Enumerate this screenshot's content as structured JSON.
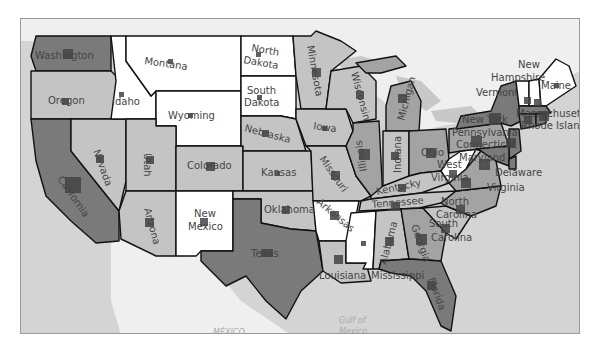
{
  "map": {
    "type": "choropleth-with-proportional-markers",
    "colors": {
      "ocean": "#d4d4d4",
      "foreign_land": "#efefef",
      "lakes": "#c8c8c8",
      "level_1": "#ffffff",
      "level_2": "#c4c4c4",
      "level_3": "#a3a3a3",
      "level_4": "#7a7a7a",
      "marker": "#444444",
      "border": "#111111"
    },
    "geo_labels": {
      "mexico": "MÉXICO",
      "gulf": "Gulf of",
      "gulf2": "Mexico"
    },
    "states": [
      {
        "name": "Washington",
        "level": 4,
        "marker": 9
      },
      {
        "name": "Oregon",
        "level": 2,
        "marker": 7
      },
      {
        "name": "California",
        "level": 4,
        "marker": 16
      },
      {
        "name": "Nevada",
        "level": 2,
        "marker": 8
      },
      {
        "name": "Idaho",
        "level": 1,
        "marker": 5
      },
      {
        "name": "Montana",
        "level": 1,
        "marker": 5
      },
      {
        "name": "Wyoming",
        "level": 1,
        "marker": 5
      },
      {
        "name": "Utah",
        "level": 2,
        "marker": 8
      },
      {
        "name": "Arizona",
        "level": 2,
        "marker": 9
      },
      {
        "name": "Colorado",
        "level": 2,
        "marker": 9
      },
      {
        "name": "New Mexico",
        "level": 1,
        "marker": 8
      },
      {
        "name": "North Dakota",
        "level": 1,
        "marker": 5
      },
      {
        "name": "South Dakota",
        "level": 1,
        "marker": 5
      },
      {
        "name": "Nebraska",
        "level": 2,
        "marker": 7
      },
      {
        "name": "Kansas",
        "level": 2,
        "marker": 5
      },
      {
        "name": "Oklahoma",
        "level": 2,
        "marker": 8
      },
      {
        "name": "Texas",
        "level": 4,
        "marker": 12
      },
      {
        "name": "Minnesota",
        "level": 2,
        "marker": 9
      },
      {
        "name": "Iowa",
        "level": 2,
        "marker": 5
      },
      {
        "name": "Missouri",
        "level": 2,
        "marker": 9
      },
      {
        "name": "Arkansas",
        "level": 1,
        "marker": 9
      },
      {
        "name": "Louisiana",
        "level": 2,
        "marker": 9
      },
      {
        "name": "Wisconsin",
        "level": 2,
        "marker": 8
      },
      {
        "name": "Illinois",
        "level": 3,
        "marker": 11
      },
      {
        "name": "Michigan",
        "level": 3,
        "marker": 9
      },
      {
        "name": "Indiana",
        "level": 2,
        "marker": 8
      },
      {
        "name": "Ohio",
        "level": 3,
        "marker": 10
      },
      {
        "name": "Kentucky",
        "level": 2,
        "marker": 8
      },
      {
        "name": "Tennessee",
        "level": 2,
        "marker": 9
      },
      {
        "name": "Mississippi",
        "level": 1,
        "marker": 5
      },
      {
        "name": "Alabama",
        "level": 2,
        "marker": 9
      },
      {
        "name": "Georgia",
        "level": 3,
        "marker": 11
      },
      {
        "name": "Florida",
        "level": 4,
        "marker": 9
      },
      {
        "name": "South Carolina",
        "level": 2,
        "marker": 9
      },
      {
        "name": "North Carolina",
        "level": 3,
        "marker": 9
      },
      {
        "name": "Virginia",
        "level": 3,
        "marker": 10
      },
      {
        "name": "West Virginia",
        "level": 1,
        "marker": 8
      },
      {
        "name": "Pennsylvania",
        "level": 3,
        "marker": 11
      },
      {
        "name": "New York",
        "level": 4,
        "marker": 12
      },
      {
        "name": "Vermont",
        "level": 1,
        "marker": 7
      },
      {
        "name": "New Hampshire",
        "level": 1,
        "marker": 7
      },
      {
        "name": "Maine",
        "level": 1,
        "marker": 5
      },
      {
        "name": "Massachusetts",
        "level": 4,
        "marker": 10
      },
      {
        "name": "Connecticut",
        "level": 4,
        "marker": 8
      },
      {
        "name": "Rhode Island",
        "level": 4,
        "marker": 6
      },
      {
        "name": "New Jersey",
        "level": 4,
        "marker": 10
      },
      {
        "name": "Delaware",
        "level": 4,
        "marker": 6
      },
      {
        "name": "Maryland",
        "level": 4,
        "marker": 11
      }
    ],
    "labels": {
      "washington": "Washington",
      "oregon": "Oregon",
      "california": "California",
      "nevada": "Nevada",
      "idaho": "Idaho",
      "montana": "Montana",
      "wyoming": "Wyoming",
      "utah": "Utah",
      "arizona": "Arizona",
      "colorado": "Colorado",
      "new_mexico_1": "New",
      "new_mexico_2": "Mexico",
      "north_dakota_1": "North",
      "north_dakota_2": "Dakota",
      "south_dakota_1": "South",
      "south_dakota_2": "Dakota",
      "nebraska": "Nebraska",
      "kansas": "Kansas",
      "oklahoma": "Oklahoma",
      "texas": "Texas",
      "minnesota": "Minnesota",
      "iowa": "Iowa",
      "missouri": "Missouri",
      "arkansas": "Arkansas",
      "louisiana": "Louisiana",
      "wisconsin": "Wisconsin",
      "illinois": "Illinois",
      "michigan": "Michigan",
      "indiana": "Indiana",
      "ohio": "Ohio",
      "kentucky": "Kentucky",
      "tennessee": "Tennessee",
      "mississippi": "Mississippi",
      "alabama": "Alabama",
      "georgia": "Georgia",
      "florida": "Florida",
      "south_carolina_1": "South",
      "south_carolina_2": "Carolina",
      "north_carolina_1": "North",
      "north_carolina_2": "Carolina",
      "virginia": "Virginia",
      "west_virginia_1": "West",
      "west_virginia_2": "Virginia",
      "pennsylvania": "Pennsylvania",
      "new_york": "New York",
      "vermont": "Vermont",
      "new_hampshire_1": "New",
      "new_hampshire_2": "Hampshire",
      "maine": "Maine",
      "massachusetts": "Massachusetts",
      "connecticut": "Connecticut",
      "rhode_island": "Rhode Island",
      "maryland": "Maryland",
      "delaware": "Delaware"
    }
  }
}
